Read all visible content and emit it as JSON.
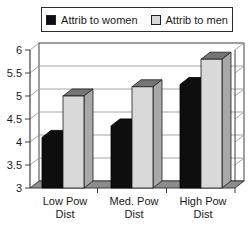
{
  "legend": {
    "items": [
      {
        "label": "Attrib to women",
        "color": "#0e0e0e"
      },
      {
        "label": "Attrib to men",
        "color": "#d9d9d9"
      }
    ]
  },
  "chart_data": {
    "type": "bar",
    "projection": "3d-column",
    "title": "",
    "categories": [
      "Low Pow Dist",
      "Med. Pow Dist",
      "High Pow Dist"
    ],
    "category_lines": [
      [
        "Low Pow",
        "Dist"
      ],
      [
        "Med. Pow",
        "Dist"
      ],
      [
        "High Pow",
        "Dist"
      ]
    ],
    "series": [
      {
        "name": "Attrib to women",
        "values": [
          4.1,
          4.35,
          5.25
        ],
        "color": "#0e0e0e",
        "top_color": "#0e0e0e",
        "side_color": "#0e0e0e"
      },
      {
        "name": "Attrib to men",
        "values": [
          5.0,
          5.2,
          5.8
        ],
        "color": "#d9d9d9",
        "top_color": "#757575",
        "side_color": "#a8a8a8"
      }
    ],
    "ylim": [
      3,
      6
    ],
    "yticks": [
      6,
      5.5,
      5,
      4.5,
      4,
      3.5,
      3
    ],
    "grid": true,
    "legend_position": "top",
    "wall_color": "#ffffff",
    "floor_color": "#8c8c8c",
    "gridline_color": "#9b9b9b",
    "frame_color": "#3f3f3f",
    "text_color": "#1a1a1a"
  }
}
